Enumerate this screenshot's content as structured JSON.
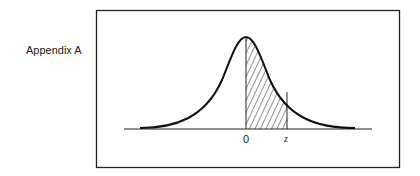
{
  "caption": "Appendix A",
  "diagram": {
    "type": "standard normal distribution curve",
    "shaded_region": "area between 0 and z",
    "axis_labels": {
      "origin": "0",
      "z": "z"
    }
  }
}
